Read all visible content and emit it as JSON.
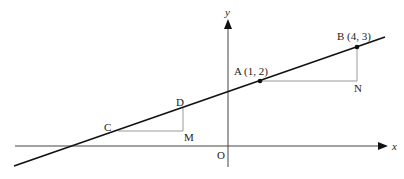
{
  "diagram": {
    "type": "coordinate-geometry",
    "axes": {
      "x_label": "x",
      "y_label": "y",
      "origin_label": "O"
    },
    "points": {
      "A": {
        "label": "A (1, 2)",
        "coords": [
          1,
          2
        ]
      },
      "B": {
        "label": "B (4, 3)",
        "coords": [
          4,
          3
        ]
      },
      "C": {
        "label": "C"
      },
      "D": {
        "label": "D"
      },
      "M": {
        "label": "M"
      },
      "N": {
        "label": "N"
      }
    },
    "colors": {
      "line": "#111111",
      "axis": "#333333",
      "helper": "#999999"
    }
  }
}
